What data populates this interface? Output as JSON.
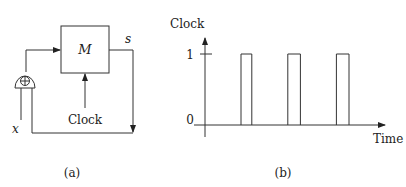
{
  "figure": {
    "panel_a": {
      "caption": "(a)",
      "block_label": "M",
      "output_label": "s",
      "input_label": "x",
      "clock_label": "Clock",
      "adder_symbol": "⊕",
      "icons": [
        "adder-icon",
        "arrow-icon"
      ]
    },
    "panel_b": {
      "caption": "(b)",
      "y_axis_label": "Clock",
      "x_axis_label": "Time",
      "y_tick_high": "1",
      "y_tick_low": "0"
    }
  },
  "chart_data": {
    "type": "line",
    "title": "",
    "xlabel": "Time",
    "ylabel": "Clock",
    "yticks": [
      "0",
      "1"
    ],
    "ylim": [
      0,
      1
    ],
    "xlim": [
      0,
      10
    ],
    "pulses": [
      {
        "start": 2.0,
        "end": 2.6
      },
      {
        "start": 4.6,
        "end": 5.3
      },
      {
        "start": 7.3,
        "end": 8.0
      }
    ],
    "grid": false,
    "legend": "none"
  }
}
